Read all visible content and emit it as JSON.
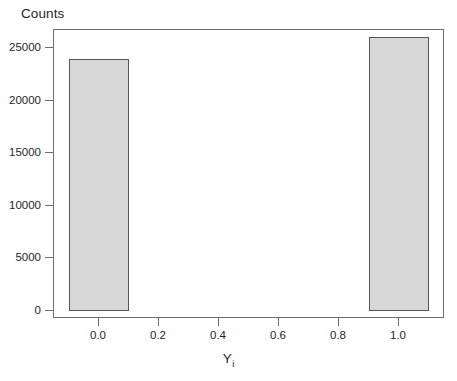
{
  "chart_data": {
    "type": "bar",
    "title": "",
    "subtitle": "",
    "xlabel": "Y",
    "xlabel_subscript": "i",
    "ylabel": "Counts",
    "categories": [
      "0.0",
      "1.0"
    ],
    "x": [
      0,
      1
    ],
    "values": [
      24000,
      26000
    ],
    "bar_width": 0.2,
    "xlim": [
      -0.15,
      1.15
    ],
    "ylim": [
      0,
      26800
    ],
    "xticks": [
      0.0,
      0.2,
      0.4,
      0.6,
      0.8,
      1.0
    ],
    "xtick_labels": [
      "0.0",
      "0.2",
      "0.4",
      "0.6",
      "0.8",
      "1.0"
    ],
    "yticks": [
      0,
      5000,
      10000,
      15000,
      20000,
      25000
    ],
    "ytick_labels": [
      "0",
      "5000",
      "10000",
      "15000",
      "20000",
      "25000"
    ],
    "grid": false,
    "legend": null,
    "legend_position": "none",
    "bar_fill_color": "#d7d7d7",
    "bar_edge_color": "#555555",
    "frame_color": "#6e6e6e",
    "background_color": "#ffffff",
    "annotations": []
  },
  "axes": {
    "y_title": "Counts",
    "x_title_base": "Y",
    "x_title_sub": "i"
  }
}
